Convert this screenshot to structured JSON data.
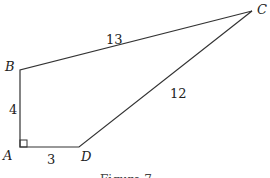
{
  "figure": {
    "caption": "Figure 7",
    "vertices": {
      "A": {
        "label": "A",
        "x": 20,
        "y": 147
      },
      "B": {
        "label": "B",
        "x": 20,
        "y": 70
      },
      "C": {
        "label": "C",
        "x": 252,
        "y": 11
      },
      "D": {
        "label": "D",
        "x": 79,
        "y": 147
      }
    },
    "sides": {
      "AB": "4",
      "AD": "3",
      "BC": "13",
      "CD": "12"
    },
    "right_angle_at": "A",
    "stroke_color": "#333333"
  }
}
